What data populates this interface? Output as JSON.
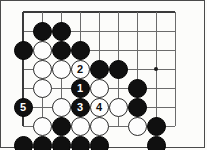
{
  "diagram": {
    "kind": "go-board-problem-diagram",
    "title": "",
    "board": {
      "cols": 9,
      "rows": 7,
      "spacing": 19,
      "origin_x": 23,
      "origin_y": 12,
      "line_color": "#6b6b6b",
      "edge_color": "#3a3a3a",
      "background": "#fcfcfa",
      "border_color": "#4a4a4a",
      "star_points": [
        {
          "col": 7,
          "row": 3
        }
      ],
      "edges": {
        "top": true,
        "left": true,
        "right": false,
        "bottom": false
      }
    },
    "stones": [
      {
        "col": 1,
        "row": 1,
        "color": "black",
        "label": ""
      },
      {
        "col": 2,
        "row": 1,
        "color": "black",
        "label": ""
      },
      {
        "col": 0,
        "row": 2,
        "color": "black",
        "label": ""
      },
      {
        "col": 1,
        "row": 2,
        "color": "white",
        "label": ""
      },
      {
        "col": 2,
        "row": 2,
        "color": "black",
        "label": ""
      },
      {
        "col": 3,
        "row": 2,
        "color": "black",
        "label": ""
      },
      {
        "col": 1,
        "row": 3,
        "color": "white",
        "label": ""
      },
      {
        "col": 2,
        "row": 3,
        "color": "white",
        "label": ""
      },
      {
        "col": 3,
        "row": 3,
        "color": "white",
        "label": "2"
      },
      {
        "col": 4,
        "row": 3,
        "color": "black",
        "label": ""
      },
      {
        "col": 5,
        "row": 3,
        "color": "black",
        "label": ""
      },
      {
        "col": 1,
        "row": 4,
        "color": "white",
        "label": ""
      },
      {
        "col": 3,
        "row": 4,
        "color": "black",
        "label": "1"
      },
      {
        "col": 4,
        "row": 4,
        "color": "white",
        "label": ""
      },
      {
        "col": 6,
        "row": 4,
        "color": "black",
        "label": ""
      },
      {
        "col": 0,
        "row": 5,
        "color": "black",
        "label": "5"
      },
      {
        "col": 2,
        "row": 5,
        "color": "white",
        "label": ""
      },
      {
        "col": 3,
        "row": 5,
        "color": "black",
        "label": "3"
      },
      {
        "col": 4,
        "row": 5,
        "color": "white",
        "label": "4"
      },
      {
        "col": 5,
        "row": 5,
        "color": "white",
        "label": ""
      },
      {
        "col": 6,
        "row": 5,
        "color": "black",
        "label": ""
      },
      {
        "col": 1,
        "row": 6,
        "color": "white",
        "label": ""
      },
      {
        "col": 2,
        "row": 6,
        "color": "black",
        "label": ""
      },
      {
        "col": 3,
        "row": 6,
        "color": "white",
        "label": ""
      },
      {
        "col": 4,
        "row": 6,
        "color": "white",
        "label": ""
      },
      {
        "col": 6,
        "row": 6,
        "color": "white",
        "label": ""
      },
      {
        "col": 7,
        "row": 6,
        "color": "black",
        "label": ""
      },
      {
        "col": 0,
        "row": 7,
        "color": "black",
        "label": ""
      },
      {
        "col": 1,
        "row": 7,
        "color": "black",
        "label": ""
      },
      {
        "col": 2,
        "row": 7,
        "color": "black",
        "label": ""
      },
      {
        "col": 3,
        "row": 7,
        "color": "black",
        "label": ""
      },
      {
        "col": 4,
        "row": 7,
        "color": "black",
        "label": ""
      },
      {
        "col": 7,
        "row": 7,
        "color": "black",
        "label": ""
      },
      {
        "col": 4,
        "row": 8,
        "color": "black",
        "label": ""
      }
    ],
    "move_labels": {
      "1": "black-move-1",
      "2": "white-move-2",
      "3": "black-move-3",
      "4": "white-move-4",
      "5": "black-move-5"
    }
  }
}
